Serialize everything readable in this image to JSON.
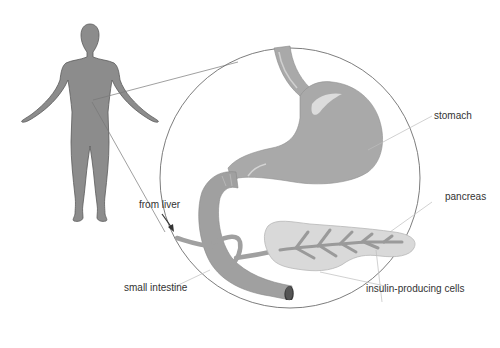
{
  "diagram": {
    "type": "anatomical-illustration",
    "colors": {
      "body_fill": "#8c8c8c",
      "body_outline": "#555555",
      "organ_fill": "#a9a9a9",
      "organ_highlight": "#dcdcdc",
      "pancreas_fill": "#d9d9d9",
      "duct_fill": "#9a9a9a",
      "magnifier_circle": "#6e6e6e",
      "leader_line": "#bdbdbd",
      "text": "#333333"
    },
    "labels": {
      "stomach": "stomach",
      "pancreas": "pancreas",
      "from_liver": "from liver",
      "small_intestine": "small intestine",
      "insulin_cells": "insulin-producing cells"
    }
  }
}
